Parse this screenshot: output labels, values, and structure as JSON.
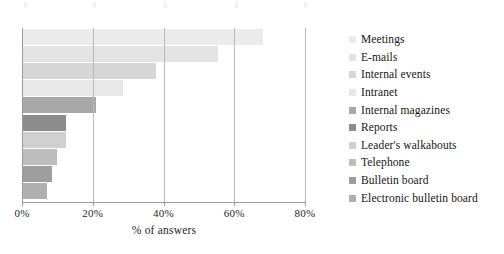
{
  "chart_data": {
    "type": "bar",
    "orientation": "horizontal",
    "title": "",
    "xlabel": "% of answers",
    "ylabel": "",
    "xlim": [
      0,
      80
    ],
    "xticks": [
      "0%",
      "20%",
      "40%",
      "60%",
      "80%"
    ],
    "xtick_values": [
      0,
      20,
      40,
      60,
      80
    ],
    "grid": true,
    "legend_position": "right",
    "categories": [
      "Meetings",
      "E-mails",
      "Internal events",
      "Intranet",
      "Internal magazines",
      "Reports",
      "Leader's walkabouts",
      "Telephone",
      "Bulletin board",
      "Electronic bulletin board"
    ],
    "values": [
      68,
      55.5,
      38,
      28.5,
      21,
      12.5,
      12.5,
      10,
      8.5,
      7
    ],
    "colors": [
      "#ebebeb",
      "#e3e3e3",
      "#d6d6d6",
      "#e8e8e8",
      "#a8a8a8",
      "#8c8c8c",
      "#d0d0d0",
      "#bdbdbd",
      "#9e9e9e",
      "#b0b0b0"
    ]
  },
  "axis": {
    "x_title": "% of answers",
    "ticks": [
      {
        "label": "0%",
        "value": 0
      },
      {
        "label": "20%",
        "value": 20
      },
      {
        "label": "40%",
        "value": 40
      },
      {
        "label": "60%",
        "value": 60
      },
      {
        "label": "80%",
        "value": 80
      }
    ]
  },
  "legend": {
    "items": [
      {
        "label": "Meetings",
        "color": "#ebebeb"
      },
      {
        "label": "E-mails",
        "color": "#e3e3e3"
      },
      {
        "label": "Internal events",
        "color": "#d6d6d6"
      },
      {
        "label": "Intranet",
        "color": "#e8e8e8"
      },
      {
        "label": "Internal magazines",
        "color": "#a8a8a8"
      },
      {
        "label": "Reports",
        "color": "#8c8c8c"
      },
      {
        "label": "Leader's walkabouts",
        "color": "#d0d0d0"
      },
      {
        "label": "Telephone",
        "color": "#bdbdbd"
      },
      {
        "label": "Bulletin board",
        "color": "#9e9e9e"
      },
      {
        "label": "Electronic bulletin board",
        "color": "#b0b0b0"
      }
    ]
  }
}
